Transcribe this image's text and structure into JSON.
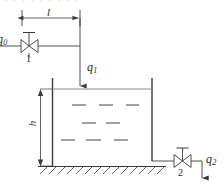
{
  "figure": {
    "title_clipped": "· · · · · · · · ·",
    "stroke_color": "#3a3a3a",
    "faint_stroke_color": "#8d8d90",
    "background_color": "#ffffff"
  },
  "labels": {
    "inflow_source": {
      "base": "q",
      "sub": "0"
    },
    "inflow_tank": {
      "base": "q",
      "sub": "1"
    },
    "outflow": {
      "base": "q",
      "sub": "2"
    },
    "length_dimension": "l",
    "height_dimension": "h",
    "valve_one": "1",
    "valve_two": "2"
  },
  "geometry": {
    "dimension_line_l": {
      "x1": 22,
      "x2": 80,
      "y": 18
    },
    "inlet_pipe_y": 46,
    "inlet_valve_x": 29,
    "drop_pipe_x": 80,
    "drop_arrow_tip_y": 88,
    "tank": {
      "left": 52,
      "right": 152,
      "water_top": 89,
      "bottom": 166
    },
    "height_dimension_x": 40,
    "ground_line": {
      "x1": 38,
      "x2": 166,
      "y": 166
    },
    "outlet_pipe_y": 161,
    "outlet_valve_x": 182,
    "outflow_arrow_x": 202
  }
}
